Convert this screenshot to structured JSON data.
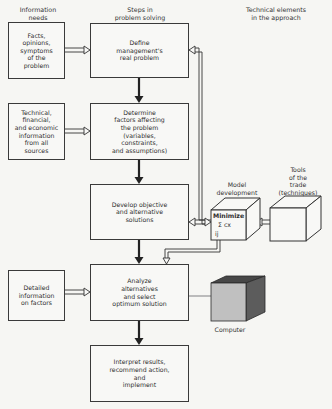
{
  "headers": {
    "information_needs": "Information\nneeds",
    "steps": "Steps in\nproblem solving",
    "technical": "Technical elements\nin the approach"
  },
  "information_boxes": [
    {
      "text": "Facts,\nopinions,\nsymptoms\nof the\nproblem"
    },
    {
      "text": "Technical,\nfinancial,\nand economic\ninformation\nfrom all\nsources"
    },
    {
      "text": "Detailed\ninformation\non factors"
    }
  ],
  "steps": [
    {
      "text": "Define\nmanagement's\nreal problem"
    },
    {
      "text": "Determine\nfactors affecting\nthe problem\n(variables,\nconstraints,\nand assumptions)"
    },
    {
      "text": "Develop objective\nand alternative\nsolutions"
    },
    {
      "text": "Analyze\nalternatives\nand select\noptimum solution"
    },
    {
      "text": "Interpret results,\nrecommend action,\nand\nimplement"
    }
  ],
  "technical_elements": {
    "model": {
      "label": "Model\ndevelopment",
      "line1": "Minimize",
      "line2": "Σ cx",
      "line3": "ij"
    },
    "tools": {
      "label": "Tools\nof the\ntrade\n(techniques)"
    },
    "computer": {
      "label": "Computer"
    }
  },
  "colors": {
    "line": "#2a2a2a",
    "box_border": "#3a3a3a",
    "computer_top": "#4a4a4a",
    "computer_side": "#5a5a5a",
    "computer_front": "#bdbdbd"
  }
}
